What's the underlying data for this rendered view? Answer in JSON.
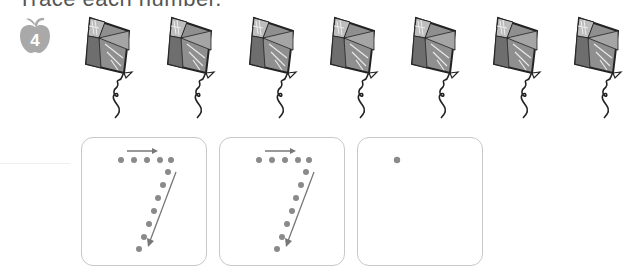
{
  "instruction": {
    "title": "Trace each number."
  },
  "badge": {
    "icon": "apple-icon",
    "number": "4",
    "color": "#a9a9a9"
  },
  "kites": {
    "count": 7,
    "icon": "kite-icon",
    "positions_x": [
      85,
      167,
      249,
      330,
      411,
      493,
      574
    ]
  },
  "tracing": {
    "digit": "7",
    "dot_color": "#8a8a8a",
    "arrow_color": "#777777",
    "boxes": [
      {
        "type": "dotted-guide",
        "label": "trace-7-guide-1"
      },
      {
        "type": "dotted-guide",
        "label": "trace-7-guide-2"
      },
      {
        "type": "start-dot-only",
        "label": "trace-7-blank"
      }
    ]
  }
}
